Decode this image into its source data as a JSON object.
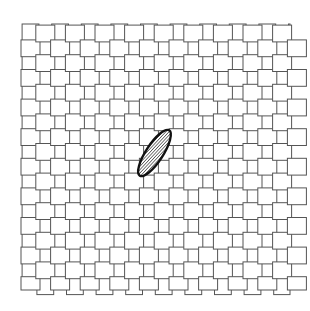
{
  "figure": {
    "title": "Plain woven fabric with embedded elliptical defect",
    "type": "technical-line-diagram",
    "background_color": "#ffffff",
    "width": 310,
    "height": 311
  },
  "weave": {
    "pattern_name": "plain-weave",
    "stroke_color": "#555555",
    "fill_color": "#ffffff",
    "stroke_width": 1,
    "origin_x": 21,
    "origin_y": 24,
    "pitch": 29.6,
    "strand_thickness": 19,
    "gap": 10.6,
    "columns": 9,
    "rows": 9,
    "warp_label": "warp-strand",
    "weft_label": "weft-strand",
    "extent_x_end": 290,
    "extent_y_end": 290
  },
  "defect": {
    "label": "elliptical-defect",
    "shape": "ellipse",
    "center_x": 154.5,
    "center_y": 153,
    "radius_major": 27,
    "radius_minor": 8.5,
    "rotation_deg": 57,
    "outline_color": "#111111",
    "outline_width": 2.4,
    "hatch_color": "#1a1a1a",
    "hatch_fill": "#ffffff",
    "hatch_spacing": 2.3,
    "hatch_angle_deg": 100
  }
}
